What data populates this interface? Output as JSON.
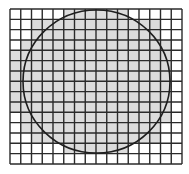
{
  "figure": {
    "grid": {
      "columns": 16,
      "rows": 15,
      "x0": 10,
      "y0": 9,
      "cell_width": 10.75,
      "cell_height": 10.33,
      "line_color": "#2a2a2a",
      "line_width": 1.4
    },
    "shading": {
      "fill_color": "#dcdcdc",
      "background_color": "#ffffff",
      "row_spans": [
        [
          5,
          10
        ],
        [
          2,
          13
        ],
        [
          2,
          13
        ],
        [
          1,
          14
        ],
        [
          0,
          14
        ],
        [
          0,
          14
        ],
        [
          0,
          14
        ],
        [
          0,
          14
        ],
        [
          0,
          14
        ],
        [
          0,
          14
        ],
        [
          1,
          14
        ],
        [
          1,
          13
        ],
        [
          2,
          13
        ],
        [
          5,
          10
        ],
        null
      ]
    },
    "circle": {
      "cx": 96.5,
      "cy": 81.5,
      "rx": 73.5,
      "ry": 71.5,
      "stroke_color": "#1e1e1e",
      "stroke_width": 1.6
    }
  }
}
